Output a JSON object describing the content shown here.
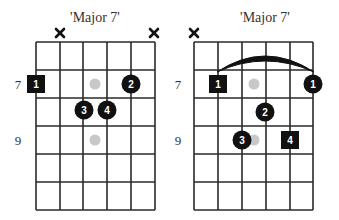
{
  "diagrams": [
    {
      "title": "'Major 7'",
      "fret_labels": [
        {
          "text": "7",
          "row": 1
        },
        {
          "text": "9",
          "row": 3
        }
      ],
      "muted_strings": [
        2,
        6
      ],
      "barre": null,
      "markers": [
        {
          "string": 1,
          "fret_row": 1,
          "finger": "1",
          "shape": "square",
          "role": "root"
        },
        {
          "string": 5,
          "fret_row": 1,
          "finger": "2",
          "shape": "circle"
        },
        {
          "string": 3,
          "fret_row": 2,
          "finger": "3",
          "shape": "circle",
          "position": "on-fret-line"
        },
        {
          "string": 4,
          "fret_row": 2,
          "finger": "4",
          "shape": "circle",
          "position": "on-fret-line"
        }
      ],
      "inlay_dots": [
        {
          "fret_row": 1
        },
        {
          "fret_row": 3
        }
      ]
    },
    {
      "title": "'Major 7'",
      "fret_labels": [
        {
          "text": "7",
          "row": 1
        },
        {
          "text": "9",
          "row": 3
        }
      ],
      "muted_strings": [
        1
      ],
      "barre": {
        "from_string": 2,
        "to_string": 6,
        "fret_row": 1
      },
      "markers": [
        {
          "string": 2,
          "fret_row": 1,
          "finger": "1",
          "shape": "square",
          "role": "root"
        },
        {
          "string": 6,
          "fret_row": 1,
          "finger": "1",
          "shape": "circle"
        },
        {
          "string": 4,
          "fret_row": 2,
          "finger": "2",
          "shape": "circle"
        },
        {
          "string": 3,
          "fret_row": 3,
          "finger": "3",
          "shape": "circle"
        },
        {
          "string": 5,
          "fret_row": 3,
          "finger": "4",
          "shape": "square",
          "role": "root"
        }
      ],
      "inlay_dots": [
        {
          "fret_row": 1
        },
        {
          "fret_row": 3
        }
      ]
    }
  ],
  "colors": {
    "grid": "#2a2a2a",
    "marker": "#111111",
    "inlay": "#c8c8c8",
    "text": "#333333"
  }
}
